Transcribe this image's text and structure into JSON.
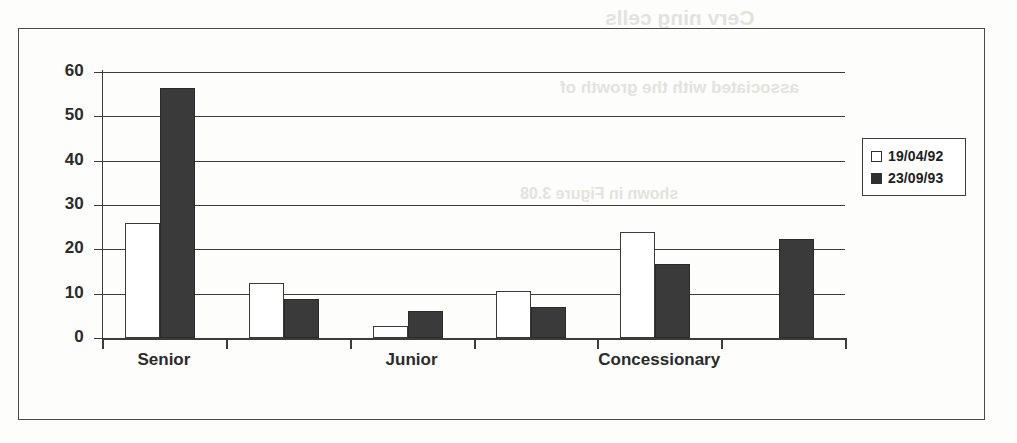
{
  "chart_data": {
    "type": "bar",
    "title": "",
    "xlabel": "",
    "ylabel": "",
    "ylim": [
      0,
      60
    ],
    "yticks": [
      0,
      10,
      20,
      30,
      40,
      50,
      60
    ],
    "grid": true,
    "legend_position": "right",
    "categories": [
      "Senior",
      "",
      "Junior",
      "",
      "Concessionary",
      ""
    ],
    "tick_labels": [
      "Senior",
      "Junior",
      "Concessionary"
    ],
    "series": [
      {
        "name": "19/04/92",
        "color": "#ffffff",
        "values": [
          26,
          12.5,
          2.8,
          10.5,
          24,
          null
        ]
      },
      {
        "name": "23/09/93",
        "color": "#3a3a3a",
        "values": [
          56.4,
          8.8,
          6,
          7,
          16.6,
          22.3
        ]
      }
    ]
  },
  "legend": {
    "entries": [
      {
        "label": "19/04/92",
        "swatch": "hollow"
      },
      {
        "label": "23/09/93",
        "swatch": "filled"
      }
    ]
  },
  "axis": {
    "y_labels": [
      "60",
      "50",
      "40",
      "30",
      "20",
      "10",
      "0"
    ],
    "x_labels": [
      "Senior",
      "Junior",
      "Concessionary"
    ]
  },
  "ghost_text": {
    "line1": "Cerv ning cells",
    "line2": "associated with the growth of",
    "line3": "shown in Figure 3.08"
  }
}
